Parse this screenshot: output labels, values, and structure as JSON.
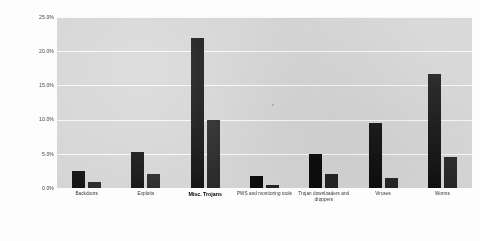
{
  "chart_data": {
    "type": "bar",
    "title": "",
    "subtitle": "",
    "xlabel": "",
    "ylabel": "Percent of reporting computers",
    "ylim": [
      0,
      25
    ],
    "y_tick_labels": [
      "25.0%",
      "20.0%",
      "15.0%",
      "10.0%",
      "5.0%",
      "0.0%"
    ],
    "y_tick_values": [
      25,
      20,
      15,
      10,
      5,
      0
    ],
    "grid": true,
    "legend": "none",
    "legend_position": "none",
    "categories": [
      "Backdoors",
      "Exploits",
      "Misc. Trojans",
      "PWS and monitoring tools",
      "Trojan downloaders and droppers",
      "Viruses",
      "Worms"
    ],
    "emphasized_category": "Misc. Trojans",
    "series": [
      {
        "name": "Series 1",
        "color": "#0d0d0d",
        "values": [
          2.5,
          5.3,
          21.9,
          1.8,
          5.0,
          9.5,
          16.6
        ]
      },
      {
        "name": "Series 2",
        "color": "#242424",
        "values": [
          0.9,
          2.0,
          10.0,
          0.4,
          2.1,
          1.5,
          4.5
        ]
      }
    ],
    "plot_background": "#d4d4d4",
    "gridline_color": "#f7f7f7",
    "page_background": "#ffffff"
  }
}
